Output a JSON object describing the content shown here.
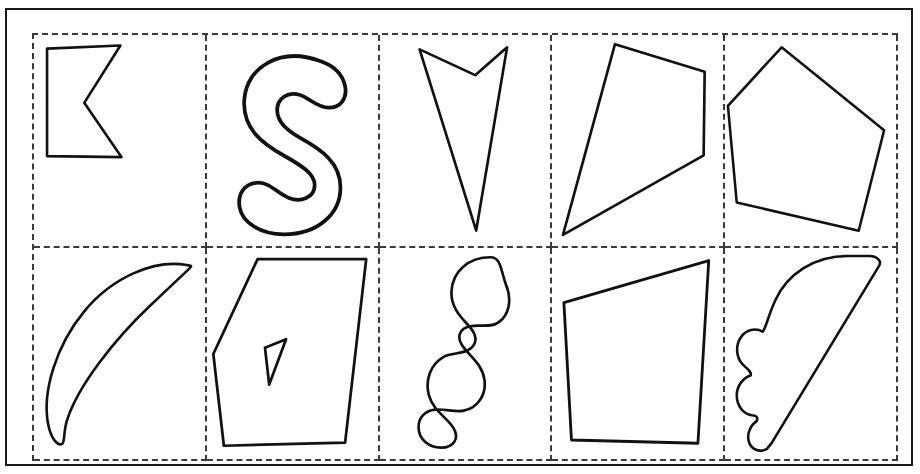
{
  "document": {
    "kind": "shape-worksheet",
    "title_sliver": "",
    "background_color": "#ffffff",
    "ink_color": "#111111",
    "grid_line_color": "#3a3a3a",
    "frame_color": "#1a1a1a",
    "frame": {
      "style": "solid",
      "x": 5,
      "y": 8,
      "width": 908,
      "height": 458
    },
    "grid": {
      "style": "dashed",
      "columns": 5,
      "rows": 2,
      "x": 25,
      "y": 23,
      "width": 866,
      "height": 428
    }
  },
  "cells": [
    {
      "index": 1,
      "row": 1,
      "col": 1,
      "name": "concave-chevron-polygon",
      "shape_type": "polygon",
      "label": "",
      "points": "13,11 86,8 50,65 87,119 13,118",
      "stroke_width": "sw25",
      "hole": null
    },
    {
      "index": 2,
      "row": 1,
      "col": 2,
      "name": "thick-s-curve",
      "shape_type": "freeform-curve",
      "label": "",
      "path": "M 78,22 C 45,10 16,27 14,55 C 12,80 30,93 48,103 C 62,111 74,118 74,128 C 74,139 62,143 52,139 C 42,135 36,126 26,126 C 14,126 8,136 10,147 C 12,160 28,170 48,170 C 76,170 96,153 96,130 C 96,109 80,98 62,88 C 50,81 42,74 42,64 C 42,54 51,48 61,51 C 70,54 76,62 86,62 C 96,62 102,54 100,44 C 98,33 90,26 78,22 Z",
      "stroke_width": "sw3",
      "hole": null
    },
    {
      "index": 3,
      "row": 1,
      "col": 3,
      "name": "downward-dart-arrow",
      "shape_type": "polygon",
      "label": "",
      "points": "8,14 62,39 93,12 63,190",
      "stroke_width": "sw25",
      "hole": null
    },
    {
      "index": 4,
      "row": 1,
      "col": 4,
      "name": "slanted-quadrilateral-kite",
      "shape_type": "polygon",
      "label": "",
      "points": "58,9 146,36 145,118 7,196",
      "stroke_width": "sw25",
      "hole": null
    },
    {
      "index": 5,
      "row": 1,
      "col": 5,
      "name": "irregular-pentagon",
      "shape_type": "polygon",
      "label": "",
      "points": "58,8 163,93 137,196 12,167 3,68",
      "stroke_width": "sw25",
      "hole": null
    },
    {
      "index": 6,
      "row": 2,
      "col": 1,
      "name": "crescent-leaf-curve",
      "shape_type": "freeform-curve",
      "label": "",
      "path": "M 152,12 C 120,6 78,24 50,58 C 22,92 8,138 14,170 C 17,186 24,192 28,190 C 31,188 29,178 33,166 C 44,132 80,86 116,52 C 136,33 150,20 155,15 C 158,12 156,13 152,12 Z",
      "stroke_width": "sw25",
      "hole": null
    },
    {
      "index": 7,
      "row": 2,
      "col": 2,
      "name": "polygon-with-triangular-hole",
      "shape_type": "polygon-with-hole",
      "label": "",
      "points": "48,8 151,8 131,182 16,185 6,98",
      "hole_points": "55,92 75,84 59,127",
      "stroke_width": "sw25"
    },
    {
      "index": 8,
      "row": 2,
      "col": 3,
      "name": "serpentine-squiggle",
      "shape_type": "freeform-curve",
      "label": "",
      "path": "M 82,9 C 60,9 45,23 44,42 C 43,58 54,68 62,77 C 68,84 70,92 62,98 C 54,104 44,101 36,106 C 24,113 18,128 22,143 C 26,158 40,165 46,175 C 52,185 46,194 34,194 C 22,194 12,186 12,174 C 12,164 19,158 28,157 C 38,156 48,160 56,158 C 70,155 78,142 76,128 C 74,112 60,104 54,94 C 49,86 52,78 62,76 C 72,74 82,78 90,72 C 100,65 103,50 97,36 C 92,22 92,9 82,9 Z",
      "stroke_width": "sw25",
      "hole": null
    },
    {
      "index": 9,
      "row": 2,
      "col": 4,
      "name": "tilted-trapezoid",
      "shape_type": "polygon",
      "label": "",
      "points": "11,48 145,9 135,178 18,175",
      "stroke_width": "sw25",
      "hole": null
    },
    {
      "index": 10,
      "row": 2,
      "col": 5,
      "name": "scalloped-wedge",
      "shape_type": "freeform-curve",
      "label": "",
      "path": "M 118,8 C 85,8 58,26 46,52 C 38,69 36,82 33,84 C 26,80 16,82 11,90 C 5,99 7,111 13,117 C 18,122 22,124 21,128 C 14,130 7,138 7,148 C 7,159 14,167 22,168 C 26,168 29,170 27,174 C 21,178 17,186 19,194 C 21,202 29,206 37,202 L 42,196 L 150,18 C 153,13 148,8 140,8 Z",
      "stroke_width": "sw25",
      "hole": null
    }
  ]
}
